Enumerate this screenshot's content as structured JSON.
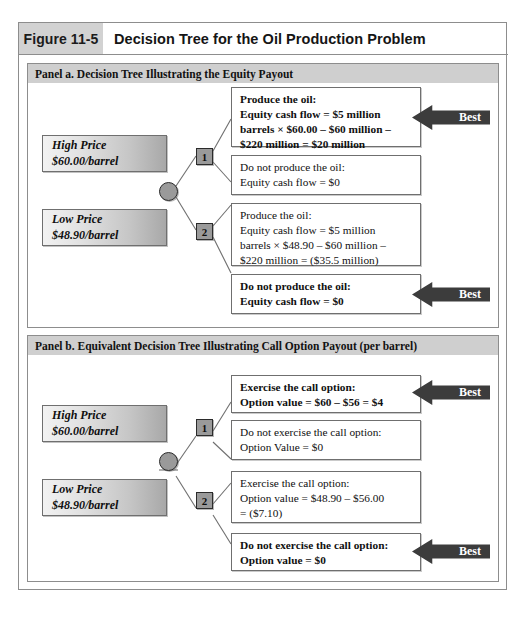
{
  "figure": {
    "label": "Figure 11-5",
    "title": "Decision Tree for the Oil Production Problem"
  },
  "panels": [
    {
      "id": "panel-a",
      "header": "Panel a. Decision Tree Illustrating the Equity Payout",
      "price_boxes": [
        {
          "name": "High Price",
          "line1": "High Price",
          "line2": "$60.00/barrel"
        },
        {
          "name": "Low Price",
          "line1": "Low Price",
          "line2": "$48.90/barrel"
        }
      ],
      "nodes": {
        "chance": "",
        "decision_1": "1",
        "decision_2": "2"
      },
      "outcomes": [
        {
          "best": true,
          "lines": [
            "Produce the oil:",
            "Equity cash flow = $5 million",
            "barrels × $60.00 – $60 million –",
            "$220 million = $20 million"
          ]
        },
        {
          "best": false,
          "lines": [
            "Do not produce the oil:",
            "Equity cash flow = $0"
          ]
        },
        {
          "best": false,
          "lines": [
            "Produce the oil:",
            "Equity cash flow = $5 million",
            "barrels × $48.90 – $60 million –",
            "$220 million = ($35.5 million)"
          ]
        },
        {
          "best": true,
          "lines": [
            "Do not produce the oil:",
            "Equity cash flow = $0"
          ]
        }
      ]
    },
    {
      "id": "panel-b",
      "header": "Panel b. Equivalent Decision Tree Illustrating Call Option Payout (per barrel)",
      "price_boxes": [
        {
          "name": "High Price",
          "line1": "High Price",
          "line2": "$60.00/barrel"
        },
        {
          "name": "Low Price",
          "line1": "Low Price",
          "line2": "$48.90/barrel"
        }
      ],
      "nodes": {
        "chance": "",
        "decision_1": "1",
        "decision_2": "2"
      },
      "outcomes": [
        {
          "best": true,
          "lines": [
            "Exercise the call option:",
            "Option value = $60 – $56 = $4"
          ]
        },
        {
          "best": false,
          "lines": [
            "Do not exercise the call option:",
            "Option Value = $0"
          ]
        },
        {
          "best": false,
          "lines": [
            "Exercise the call option:",
            "Option value = $48.90 – $56.00",
            "= ($7.10)"
          ]
        },
        {
          "best": true,
          "lines": [
            "Do not exercise the call option:",
            "Option value = $0"
          ]
        }
      ]
    }
  ],
  "best_label": "Best",
  "colors": {
    "frame": "#8d8d8d",
    "label_bg": "#d2d2d2",
    "panel_head_bg": "#cfcfcf",
    "node_fill": "#9a9a9a",
    "node_stroke": "#2b2b2b",
    "arrow_fill": "#3c3c3c",
    "line_stroke": "#6f6f6f"
  }
}
